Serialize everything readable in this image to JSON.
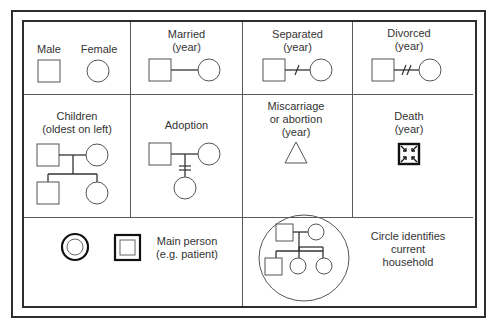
{
  "legend": {
    "cells": {
      "male_female": {
        "male_label": "Male",
        "female_label": "Female"
      },
      "married": {
        "label": "Married\n(year)"
      },
      "separated": {
        "label": "Separated\n(year)"
      },
      "divorced": {
        "label": "Divorced\n(year)"
      },
      "children": {
        "label": "Children\n(oldest on left)"
      },
      "adoption": {
        "label": "Adoption"
      },
      "miscarriage": {
        "label": "Miscarriage\nor abortion\n(year)"
      },
      "death": {
        "label": "Death\n(year)"
      },
      "main_person": {
        "label": "Main person\n(e.g. patient)"
      },
      "household": {
        "label": "Circle identifies\ncurrent\nhousehold"
      }
    },
    "icons": {
      "male": "square-icon",
      "female": "circle-icon",
      "marriage_line": "horizontal-line",
      "separation_mark": "single-slash",
      "divorce_mark": "double-slash",
      "adoption_mark": "double-bar",
      "miscarriage": "triangle-icon",
      "death": "square-with-inward-arrows-icon",
      "main_person_female": "double-circle-icon",
      "main_person_male": "double-square-icon",
      "household": "enclosing-circle-icon"
    },
    "colors": {
      "line": "#2e2e2e",
      "symbol_stroke": "#555555",
      "text": "#333333",
      "background": "#ffffff"
    }
  }
}
